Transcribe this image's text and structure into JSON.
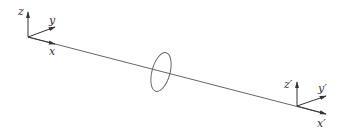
{
  "diagram": {
    "left_frame": {
      "labels": {
        "z": "z",
        "y": "y",
        "x": "x"
      }
    },
    "right_frame": {
      "labels": {
        "z": "z′",
        "y": "y′",
        "x": "x′"
      }
    },
    "colors": {
      "line": "#555555",
      "ellipse": "#666666",
      "background": "#ffffff"
    }
  }
}
